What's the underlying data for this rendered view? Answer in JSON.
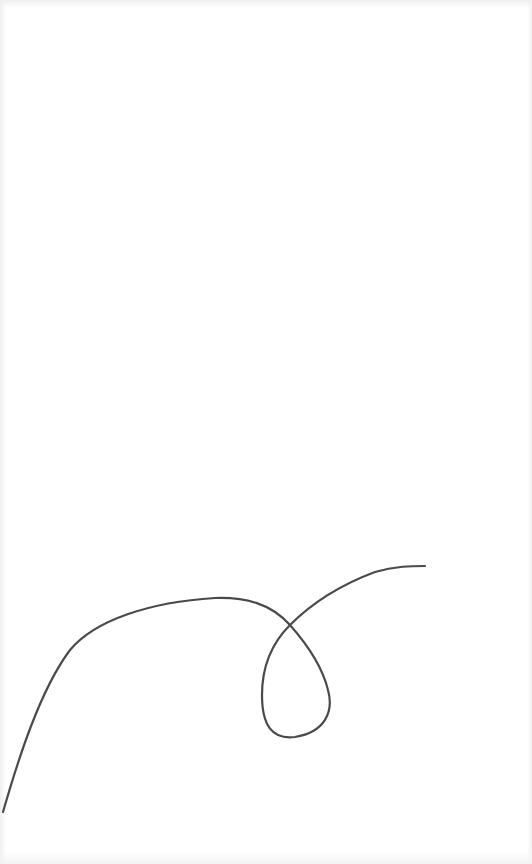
{
  "canvas": {
    "width": 532,
    "height": 864,
    "background": "#ffffff"
  },
  "drawing": {
    "description": "Single continuous hand-drawn line with a loop",
    "stroke_color": "#4a4a4a",
    "stroke_width": 2.2,
    "path": "M 3 812 C 18 760, 40 690, 70 650 C 95 620, 150 602, 215 598 C 245 597, 270 603, 290 625 C 305 642, 322 665, 328 690 C 334 712, 325 732, 295 737 C 272 740, 262 725, 262 695 C 262 665, 272 643, 290 625 C 312 603, 340 585, 375 572 C 395 566, 412 566, 425 566"
  }
}
